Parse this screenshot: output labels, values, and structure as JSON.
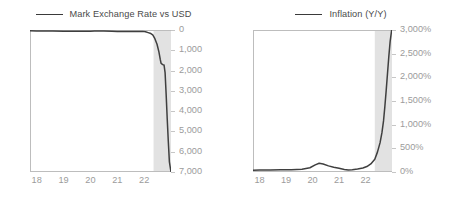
{
  "figure": {
    "panels": [
      {
        "id": "mark-exchange-rate",
        "legend_label": "Mark Exchange Rate vs USD",
        "line_color": "#3f3f3f",
        "shade_color": "#e2e2e2",
        "axis_text_color": "#9b9b9b"
      },
      {
        "id": "inflation-yoy",
        "legend_label": "Inflation (Y/Y)",
        "line_color": "#3f3f3f",
        "shade_color": "#e2e2e2",
        "axis_text_color": "#9b9b9b"
      }
    ]
  },
  "chart_data": [
    {
      "type": "line",
      "title": "",
      "legend": [
        "Mark Exchange Rate vs USD"
      ],
      "legend_position": "top-center",
      "xlabel": "",
      "ylabel": "",
      "grid": false,
      "y_axis_position": "right",
      "y_inverted": true,
      "xlim": [
        17.75,
        23.0
      ],
      "ylim": [
        0,
        7000
      ],
      "xticks": [
        18,
        19,
        20,
        21,
        22
      ],
      "xtick_labels": [
        "18",
        "19",
        "20",
        "21",
        "22"
      ],
      "yticks": [
        0,
        1000,
        2000,
        3000,
        4000,
        5000,
        6000,
        7000
      ],
      "ytick_labels": [
        "0",
        "1,000",
        "2,000",
        "3,000",
        "4,000",
        "5,000",
        "6,000",
        "7,000"
      ],
      "shaded_region": {
        "x0": 22.35,
        "x1": 23.0
      },
      "series": [
        {
          "name": "Mark Exchange Rate vs USD",
          "x": [
            17.75,
            18.0,
            18.3,
            18.6,
            19.0,
            19.4,
            19.8,
            20.0,
            20.15,
            20.3,
            20.5,
            20.8,
            21.0,
            21.3,
            21.6,
            21.8,
            21.95,
            22.05,
            22.15,
            22.25,
            22.32,
            22.4,
            22.48,
            22.55,
            22.6,
            22.63,
            22.67,
            22.7,
            22.74,
            22.78,
            22.82,
            22.86,
            22.9,
            22.94,
            23.0
          ],
          "values": [
            40,
            45,
            50,
            55,
            58,
            60,
            62,
            60,
            52,
            50,
            55,
            62,
            68,
            72,
            80,
            72,
            68,
            85,
            130,
            175,
            240,
            430,
            700,
            1080,
            1450,
            1640,
            1690,
            1710,
            1720,
            2100,
            3200,
            4400,
            5500,
            6500,
            7000
          ]
        }
      ]
    },
    {
      "type": "line",
      "title": "",
      "legend": [
        "Inflation (Y/Y)"
      ],
      "legend_position": "top-center",
      "xlabel": "",
      "ylabel": "",
      "grid": false,
      "y_axis_position": "right",
      "y_inverted": false,
      "xlim": [
        17.75,
        23.0
      ],
      "ylim": [
        0,
        3000
      ],
      "xticks": [
        18,
        19,
        20,
        21,
        22
      ],
      "xtick_labels": [
        "18",
        "19",
        "20",
        "21",
        "22"
      ],
      "yticks": [
        0,
        500,
        1000,
        1500,
        2000,
        2500,
        3000
      ],
      "ytick_labels": [
        "0%",
        "500%",
        "1,000%",
        "1,500%",
        "2,000%",
        "2,500%",
        "3,000%"
      ],
      "shaded_region": {
        "x0": 22.35,
        "x1": 23.0
      },
      "series": [
        {
          "name": "Inflation (Y/Y)",
          "x": [
            17.75,
            18.0,
            18.4,
            18.8,
            19.2,
            19.6,
            19.9,
            20.1,
            20.25,
            20.4,
            20.6,
            20.8,
            21.0,
            21.2,
            21.35,
            21.5,
            21.7,
            21.9,
            22.05,
            22.2,
            22.35,
            22.45,
            22.55,
            22.62,
            22.68,
            22.73,
            22.78,
            22.83,
            22.88,
            22.93,
            23.0
          ],
          "values": [
            35,
            40,
            42,
            45,
            50,
            58,
            90,
            150,
            185,
            170,
            130,
            100,
            80,
            55,
            42,
            48,
            65,
            85,
            115,
            170,
            270,
            420,
            620,
            830,
            1080,
            1380,
            1720,
            2080,
            2440,
            2760,
            3050
          ]
        }
      ]
    }
  ]
}
